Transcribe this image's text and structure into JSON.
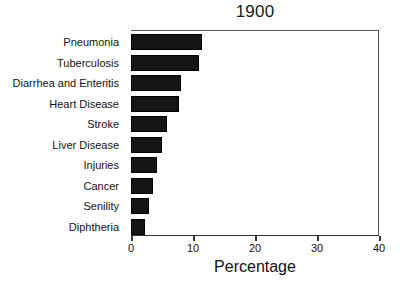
{
  "chart_data": {
    "type": "bar",
    "orientation": "horizontal",
    "title": "1900",
    "xlabel": "Percentage",
    "ylabel": "",
    "xlim": [
      0,
      40
    ],
    "xticks": [
      0,
      10,
      20,
      30,
      40
    ],
    "xtick_labels": [
      "0",
      "10",
      "20",
      "30",
      "40"
    ],
    "grid": false,
    "legend": false,
    "bar_color": "#151515",
    "categories": [
      "Pneumonia",
      "Tuberculosis",
      "Diarrhea and Enteritis",
      "Heart Disease",
      "Stroke",
      "Liver Disease",
      "Injuries",
      "Cancer",
      "Senility",
      "Diphtheria"
    ],
    "values": [
      11.5,
      11.0,
      8.0,
      7.7,
      5.8,
      5.0,
      4.2,
      3.6,
      2.9,
      2.2
    ]
  }
}
